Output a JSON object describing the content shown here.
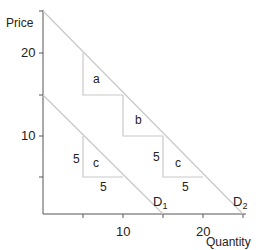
{
  "axes": {
    "ylabel": "Price",
    "xlabel": "Quantity",
    "yticks": [
      {
        "value": 5,
        "label": ""
      },
      {
        "value": 10,
        "label": "10"
      },
      {
        "value": 15,
        "label": ""
      },
      {
        "value": 20,
        "label": "20"
      },
      {
        "value": 25,
        "label": ""
      }
    ],
    "xticks": [
      {
        "value": 5,
        "label": ""
      },
      {
        "value": 10,
        "label": "10"
      },
      {
        "value": 15,
        "label": ""
      },
      {
        "value": 20,
        "label": "20"
      },
      {
        "value": 25,
        "label": ""
      }
    ]
  },
  "curves": {
    "d1": {
      "name": "D",
      "sub": "1",
      "from": [
        0,
        15
      ],
      "to": [
        15,
        0
      ]
    },
    "d2": {
      "name": "D",
      "sub": "2",
      "from": [
        0,
        25
      ],
      "to": [
        25,
        0
      ]
    }
  },
  "triangles": {
    "a": "a",
    "b": "b",
    "c_upper": "c",
    "c_lower": "c"
  },
  "dimension_labels": {
    "upper_c_height": "5",
    "upper_c_width": "5",
    "lower_c_height": "5",
    "lower_c_width": "5"
  },
  "colors": {
    "axis": "#555555",
    "curve": "#c8c8c8",
    "text": "#222222"
  }
}
